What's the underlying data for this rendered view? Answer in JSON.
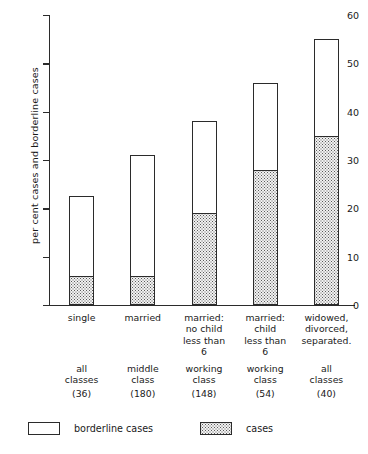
{
  "chart_data": {
    "type": "bar",
    "title": "",
    "xlabel": "",
    "ylabel": "per cent cases and borderline cases",
    "ylim": [
      0,
      60
    ],
    "yticks": [
      0,
      10,
      20,
      30,
      40,
      50,
      60
    ],
    "grid": false,
    "stacked": true,
    "legend_position": "bottom",
    "categories": [
      "single",
      "married",
      "married: no child less than 6",
      "married: child less than 6",
      "widowed, divorced, separated."
    ],
    "category_lines": [
      [
        "single"
      ],
      [
        "married"
      ],
      [
        "married:",
        "no child",
        "less than",
        "6"
      ],
      [
        "married:",
        "child",
        "less than",
        "6"
      ],
      [
        "widowed,",
        "divorced,",
        "separated."
      ]
    ],
    "sublabel_lines": [
      [
        "all",
        "classes"
      ],
      [
        "middle",
        "class"
      ],
      [
        "working",
        "class"
      ],
      [
        "working",
        "class"
      ],
      [
        "all",
        "classes"
      ]
    ],
    "counts": [
      "(36)",
      "(180)",
      "(148)",
      "(54)",
      "(40)"
    ],
    "series": [
      {
        "name": "cases",
        "values": [
          6,
          6,
          19,
          28,
          35
        ]
      },
      {
        "name": "borderline cases",
        "values": [
          16.5,
          25,
          19,
          18,
          20
        ]
      }
    ],
    "totals": [
      22.5,
      31,
      38,
      46,
      55
    ],
    "legend": [
      {
        "key": "borderline",
        "label": "borderline cases",
        "swatch": "white"
      },
      {
        "key": "cases",
        "label": "cases",
        "swatch": "dotted"
      }
    ],
    "colors": {
      "axis": "#2b2b2b",
      "borderline_fill": "#ffffff",
      "cases_fill": "#f2f2f2",
      "cases_dots": "#5a5a5a",
      "background": "#ffffff"
    }
  }
}
